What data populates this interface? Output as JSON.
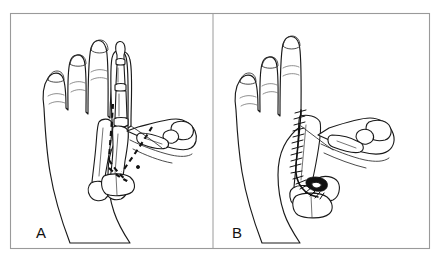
{
  "figure": {
    "kind": "medical-surgical-illustration",
    "background_color": "#ffffff",
    "line_color": "#1a1a1a",
    "frame_color": "#9a9a9a",
    "panel_count": 2
  },
  "panels": [
    {
      "id": "panel-a",
      "label": "A",
      "label_x": 36,
      "label_y": 238,
      "caption_stage": "preoperative-plan",
      "description": "Dorsal view of a hand with four extended fingers; the skeleton of the ring-side digit and the metacarpals are shown. Bold dashed lines mark the planned osteotomy and transposition path toward the radial (thumb) ray.",
      "digits_drawn": 4,
      "markings": [
        {
          "type": "dashed-line",
          "name": "osteotomy-line-longitudinal",
          "meaning": "planned bone cut along the metacarpal shaft"
        },
        {
          "type": "dashed-line",
          "name": "osteotomy-line-oblique",
          "meaning": "planned oblique transfer path toward the radial ray"
        },
        {
          "type": "dashed-line",
          "name": "osteotomy-line-base",
          "meaning": "planned cut at the metacarpal base"
        }
      ],
      "skeleton_visible": true
    },
    {
      "id": "panel-b",
      "label": "B",
      "label_x": 232,
      "label_y": 238,
      "caption_stage": "postoperative-result",
      "description": "Dorsal view of the same hand after transposition; the ring-side digit has been removed from its original position and the transferred ray is fixed in the thumb position. A running suture line with transverse tick marks runs along the dorsal aspect of the transposed ray.",
      "digits_drawn": 3,
      "markings": [
        {
          "type": "suture-line",
          "name": "running-suture",
          "meaning": "closed incision along the transposed ray",
          "tick_count": 18
        },
        {
          "type": "solid-fill",
          "name": "fixation-block",
          "meaning": "bone fixation at the metacarpal base"
        }
      ],
      "skeleton_visible": true
    }
  ],
  "labels": {
    "panel_a": "A",
    "panel_b": "B"
  },
  "colors": {
    "background": "#ffffff",
    "ink": "#1a1a1a",
    "crease": "#6a6a6a",
    "frame": "#9a9a9a",
    "fill_dark": "#111111"
  }
}
